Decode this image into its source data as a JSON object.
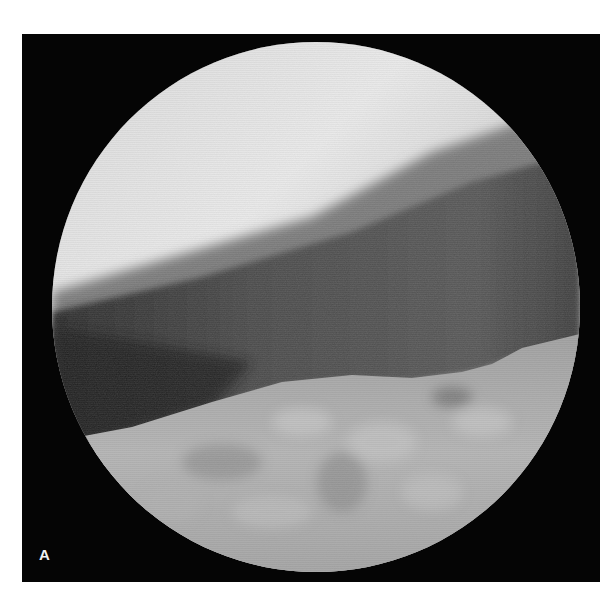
{
  "figure": {
    "panel_label": "A",
    "colors": {
      "page_background": "#ffffff",
      "frame_background": "#050505",
      "bright_region": "#e6e6e6",
      "dark_band": "#4a4a4a",
      "lower_tissue": "#a8a8a8",
      "label": "#f2f2f2"
    }
  }
}
